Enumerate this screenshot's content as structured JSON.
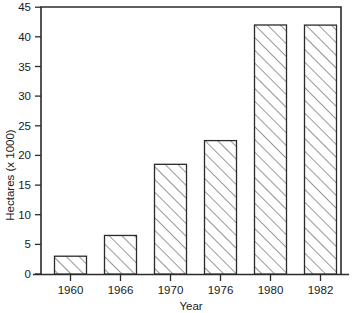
{
  "chart_data": {
    "type": "bar",
    "title": "",
    "subtitle": "",
    "categories": [
      "1960",
      "1966",
      "1970",
      "1976",
      "1980",
      "1982"
    ],
    "values": [
      1.0,
      3.0,
      6.5,
      18.5,
      22.5,
      42.0
    ],
    "series": [
      {
        "name": "Hectares",
        "values": [
          1.0,
          3.0,
          6.5,
          18.5,
          22.5,
          42.0
        ]
      }
    ],
    "xlabel": "Year",
    "ylabel": "Hectares (x 1000)",
    "ylim": [
      0,
      45
    ],
    "ytick_values": [
      0,
      5,
      10,
      15,
      20,
      25,
      30,
      35,
      40,
      45
    ],
    "ytick_labels": [
      "0",
      "5",
      "10",
      "15",
      "20",
      "25",
      "30",
      "35",
      "40",
      "45"
    ],
    "xtick_labels": [
      "1960",
      "1966",
      "1970",
      "1976",
      "1980",
      "1982"
    ],
    "grid": false,
    "legend": false,
    "legend_position": "none",
    "bar_fill": "diagonal-hatch",
    "annotations": [],
    "colors": {
      "axis": "#2b2b2b",
      "bar_outline": "#2b2b2b",
      "bar_hatch": "#3a3a3a",
      "background": "#ffffff",
      "text": "#1a1a1a"
    }
  }
}
